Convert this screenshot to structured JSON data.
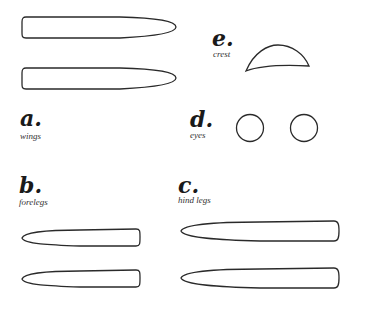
{
  "parts": [
    {
      "id": "a",
      "letter": "a.",
      "caption": "wings"
    },
    {
      "id": "b",
      "letter": "b.",
      "caption": "forelegs"
    },
    {
      "id": "c",
      "letter": "c.",
      "caption": "hind legs"
    },
    {
      "id": "d",
      "letter": "d.",
      "caption": "eyes"
    },
    {
      "id": "e",
      "letter": "e.",
      "caption": "crest"
    }
  ],
  "colors": {
    "stroke": "#2a2a2a",
    "background": "#ffffff"
  }
}
